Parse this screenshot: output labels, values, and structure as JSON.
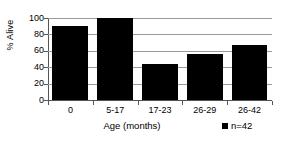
{
  "chart_data": {
    "type": "bar",
    "title": "",
    "subtitle": "",
    "categories": [
      "0",
      "5-17",
      "17-23",
      "26-29",
      "26-42"
    ],
    "values": [
      90,
      100,
      44,
      56,
      67
    ],
    "series": [
      {
        "name": "n=42",
        "values": [
          90,
          100,
          44,
          56,
          67
        ],
        "color": "#000000"
      }
    ],
    "xlabel": "Age (months)",
    "ylabel": "% Alive",
    "ylim": [
      0,
      100
    ],
    "yticks": [
      0,
      20,
      40,
      60,
      80,
      100
    ],
    "ytick_labels": [
      "0",
      "20",
      "40",
      "60",
      "80",
      "100"
    ],
    "grid": true,
    "grid_axis": "y",
    "legend": {
      "position": "bottom-right",
      "entries": [
        {
          "label": "n=42",
          "marker": "square",
          "color": "#000000"
        }
      ]
    },
    "colors": {
      "bar": "#000000",
      "grid": "#9a9a9a",
      "axis": "#555555",
      "background": "#ffffff",
      "text": "#000000"
    }
  }
}
